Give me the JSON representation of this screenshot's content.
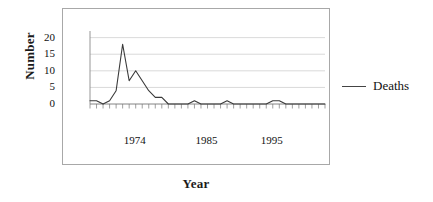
{
  "chart_data": {
    "type": "line",
    "title": "",
    "xlabel": "Year",
    "ylabel": "Number",
    "ylim": [
      0,
      22
    ],
    "yticks": [
      0,
      5,
      10,
      15,
      20
    ],
    "xtick_labels": [
      "1974",
      "1985",
      "1995"
    ],
    "xtick_years": [
      1974,
      1985,
      1995
    ],
    "grid": "horizontal",
    "legend_position": "right",
    "series": [
      {
        "name": "Deaths",
        "color": "#3a3a3a",
        "x": [
          1967,
          1968,
          1969,
          1970,
          1971,
          1972,
          1973,
          1974,
          1975,
          1976,
          1977,
          1978,
          1979,
          1980,
          1981,
          1982,
          1983,
          1984,
          1985,
          1986,
          1987,
          1988,
          1989,
          1990,
          1991,
          1992,
          1993,
          1994,
          1995,
          1996,
          1997,
          1998,
          1999,
          2000,
          2001,
          2002,
          2003
        ],
        "values": [
          1,
          1,
          0,
          1,
          4,
          18,
          7,
          10,
          7,
          4,
          2,
          2,
          0,
          0,
          0,
          0,
          1,
          0,
          0,
          0,
          0,
          1,
          0,
          0,
          0,
          0,
          0,
          0,
          1,
          1,
          0,
          0,
          0,
          0,
          0,
          0,
          0
        ]
      }
    ]
  },
  "legend": {
    "label": "Deaths"
  },
  "axis": {
    "y_title": "Number",
    "x_title": "Year"
  }
}
